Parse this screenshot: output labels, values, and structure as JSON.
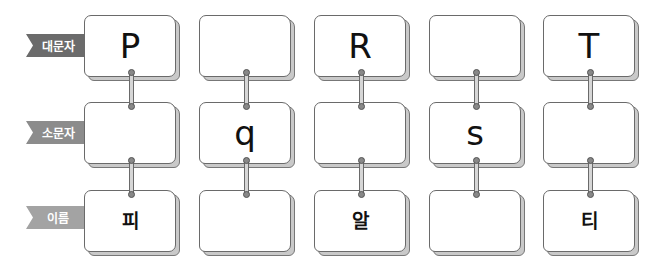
{
  "rows": [
    {
      "label": "대문자",
      "color": "#6b6b6b",
      "top": 15,
      "ribbon_top": 34,
      "cells": [
        "P",
        "",
        "R",
        "",
        "T"
      ],
      "type": "letter"
    },
    {
      "label": "소문자",
      "color": "#8c8c8c",
      "top": 102,
      "ribbon_top": 121,
      "cells": [
        "",
        "q",
        "",
        "s",
        ""
      ],
      "type": "letter"
    },
    {
      "label": "이름",
      "color": "#a3a3a3",
      "top": 190,
      "ribbon_top": 206,
      "cells": [
        "피",
        "",
        "알",
        "",
        "티"
      ],
      "type": "hangul"
    }
  ],
  "columns": [
    84,
    199,
    314,
    429,
    543
  ]
}
